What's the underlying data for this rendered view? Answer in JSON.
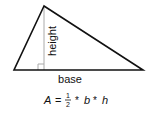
{
  "diagram": {
    "labels": {
      "height": "height",
      "base": "base"
    },
    "formula": {
      "lhs": "A",
      "equals": "=",
      "frac_num": "1",
      "frac_den": "2",
      "op1": "*",
      "b": "b",
      "op2": "*",
      "h": "h"
    },
    "colors": {
      "outline": "#111111",
      "height_line": "#aaaaaa",
      "text": "#111111"
    }
  }
}
